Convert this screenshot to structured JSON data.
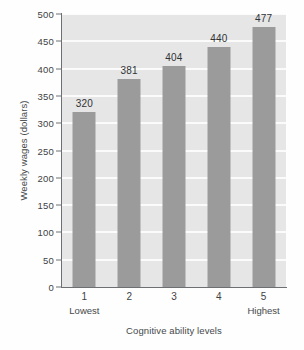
{
  "chart_data": {
    "type": "bar",
    "title": "",
    "categories": [
      "1",
      "2",
      "3",
      "4",
      "5"
    ],
    "values": [
      320,
      381,
      404,
      440,
      477
    ],
    "data_labels": [
      "320",
      "381",
      "404",
      "440",
      "477"
    ],
    "xlabel": "Cognitive ability levels",
    "ylabel": "Weekly wages (dollars)",
    "ylim": [
      0,
      500
    ],
    "ytick_labels": [
      "0",
      "50",
      "100",
      "150",
      "200",
      "250",
      "300",
      "350",
      "400",
      "450",
      "500"
    ],
    "ytick_values": [
      0,
      50,
      100,
      150,
      200,
      250,
      300,
      350,
      400,
      450,
      500
    ],
    "xtick_labels": [
      "1",
      "2",
      "3",
      "4",
      "5"
    ],
    "x_end_labels": {
      "low": "Lowest",
      "high": "Highest"
    },
    "grid": "horizontal",
    "legend": "none",
    "colors": {
      "bar_fill": "#9b9b9b",
      "plot_background": "#e6e6e6",
      "gridline": "#fbfbfb",
      "axis_line": "#6d7072",
      "text": "#3f4244",
      "figure_background": "#fefefe"
    }
  }
}
